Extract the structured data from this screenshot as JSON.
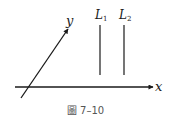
{
  "diagram": {
    "x_axis": {
      "label": "x"
    },
    "y_axis": {
      "label": "y"
    },
    "lines": [
      {
        "name": "L",
        "subscript": "1"
      },
      {
        "name": "L",
        "subscript": "2"
      }
    ],
    "colors": {
      "stroke": "#1a1a1a",
      "caption": "#555555"
    }
  },
  "caption": {
    "prefix": "圖",
    "number": "7–10"
  }
}
